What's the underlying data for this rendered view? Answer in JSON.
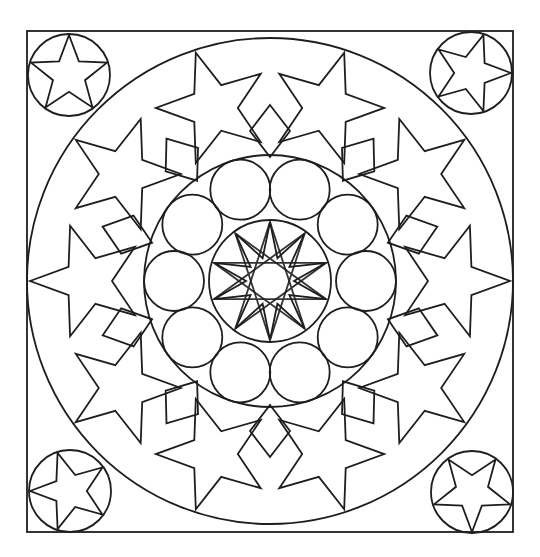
{
  "canvas": {
    "width": 540,
    "height": 557,
    "background": "#ffffff",
    "stroke": "#1e1e1e"
  },
  "artwork": {
    "title": "Mandala coloring page",
    "frame": {
      "x": 27,
      "y": 31,
      "width": 486,
      "height": 501
    },
    "center": {
      "x": 270,
      "y": 281
    },
    "outer_circle_radius": 243,
    "corner_medallions": [
      {
        "position": "top-left",
        "cx": 69,
        "cy": 75,
        "r": 41,
        "star_points": 5,
        "rotation_deg": -90
      },
      {
        "position": "top-right",
        "cx": 471,
        "cy": 73,
        "r": 41,
        "star_points": 5,
        "rotation_deg": 0
      },
      {
        "position": "bottom-left",
        "cx": 70,
        "cy": 491,
        "r": 41,
        "star_points": 5,
        "rotation_deg": 180
      },
      {
        "position": "bottom-right",
        "cx": 472,
        "cy": 492,
        "r": 41,
        "star_points": 5,
        "rotation_deg": 90
      }
    ],
    "outer_ring": {
      "large_stars": 10,
      "rhombuses": 10,
      "star_outer_radius": 238,
      "star_inner_radius": 150,
      "rotation_deg": -72
    },
    "inner_circle_radius": 126,
    "small_circles": {
      "count": 10,
      "ring_radius": 96,
      "radius": 30,
      "rotation_deg": 0
    },
    "core_circle_radius": 61,
    "core_star": {
      "points": 10,
      "outer_radius": 61,
      "inner_radius": 24
    }
  }
}
